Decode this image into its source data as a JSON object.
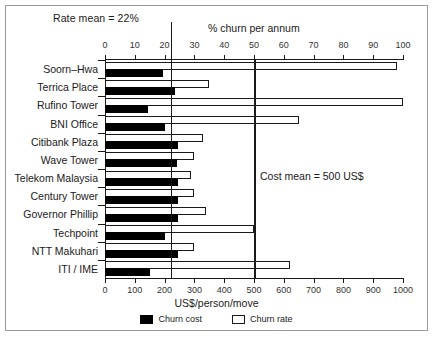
{
  "chart_data": {
    "type": "bar",
    "orientation": "horizontal",
    "title": "",
    "categories": [
      "Soorn–Hwa",
      "Terrica Place",
      "Rufino Tower",
      "BNI Office",
      "Citibank Plaza",
      "Wave Tower",
      "Telekom Malaysia",
      "Century Tower",
      "Governor Phillip",
      "Techpoint",
      "NTT Makuhari",
      "ITI / IME"
    ],
    "series": [
      {
        "name": "Churn cost",
        "unit": "US$/person/move",
        "axis": "bottom",
        "color": "#000000",
        "values": [
          195,
          235,
          145,
          200,
          245,
          240,
          245,
          245,
          245,
          200,
          245,
          150
        ]
      },
      {
        "name": "Churn rate",
        "unit": "% churn per annum",
        "axis": "top",
        "color": "#ffffff",
        "values": [
          98,
          35,
          100,
          65,
          33,
          30,
          29,
          30,
          34,
          50,
          30,
          62
        ]
      }
    ],
    "top_axis": {
      "label": "% churn per annum",
      "ticks": [
        0,
        10,
        20,
        30,
        40,
        50,
        60,
        70,
        80,
        90,
        100
      ],
      "range": [
        0,
        100
      ]
    },
    "bottom_axis": {
      "label": "US$/person/move",
      "ticks": [
        0,
        100,
        200,
        300,
        400,
        500,
        600,
        700,
        800,
        900,
        1000
      ],
      "range": [
        0,
        1000
      ]
    },
    "annotations": [
      {
        "name": "rate-mean",
        "text": "Rate mean = 22%",
        "value": 22,
        "axis": "top"
      },
      {
        "name": "cost-mean",
        "text": "Cost mean = 500 US$",
        "value": 500,
        "axis": "bottom"
      }
    ],
    "legend": {
      "position": "bottom-center",
      "entries": [
        {
          "label": "Churn cost",
          "style": "filled"
        },
        {
          "label": "Churn rate",
          "style": "hollow"
        }
      ]
    },
    "grid": false
  }
}
